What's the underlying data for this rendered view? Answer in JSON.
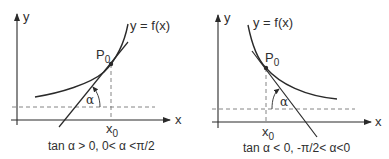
{
  "figure": {
    "panels": [
      {
        "id": "increasing",
        "y_axis_label": "y",
        "x_axis_label": "x",
        "curve_label": "y = f(x)",
        "point_label": "P",
        "point_sub": "0",
        "x0_label": "x",
        "x0_sub": "0",
        "angle_label": "α",
        "caption": "tan α > 0, 0< α <π/2"
      },
      {
        "id": "decreasing",
        "y_axis_label": "y",
        "x_axis_label": "x",
        "curve_label": "y = f(x)",
        "point_label": "P",
        "point_sub": "0",
        "x0_label": "x",
        "x0_sub": "0",
        "angle_label": "α",
        "caption": "tan α < 0, -π/2< α<0"
      }
    ],
    "colors": {
      "line": "#2a2a2a",
      "dashed": "#777777",
      "background": "#ffffff"
    }
  }
}
